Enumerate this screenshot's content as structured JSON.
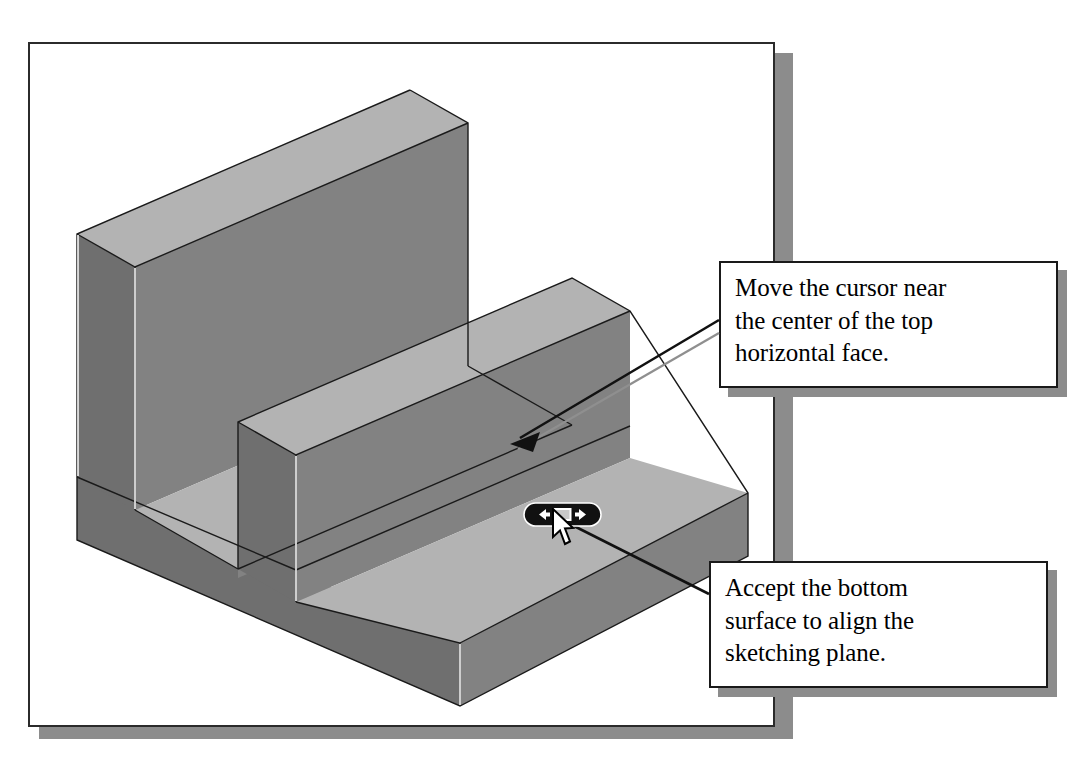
{
  "figure": {
    "frame": {
      "border_color": "#2b2b2b",
      "shadow_color": "#8c8c8c",
      "background": "#ffffff"
    }
  },
  "model": {
    "description": "isometric U-channel solid",
    "top_face_color": "#b3b3b3",
    "front_face_color": "#828282",
    "side_face_color": "#6f6f6f",
    "edge_color": "#1a1a1a",
    "highlight_edge_color": "#f2f2f2"
  },
  "callouts": [
    {
      "id": "callout-move-cursor",
      "text": "Move the cursor near the center of the top horizontal face.",
      "lines": [
        "Move the cursor near",
        "the center of the top",
        "horizontal face."
      ]
    },
    {
      "id": "callout-accept-surface",
      "text": "Accept the bottom surface to align the sketching plane.",
      "lines": [
        "Accept the bottom",
        "surface to align the",
        "sketching plane."
      ]
    }
  ],
  "widget": {
    "name": "face-cycle-widget",
    "left_arrow": "left-arrow-icon",
    "right_arrow": "right-arrow-icon",
    "center_button": "accept-face-button",
    "body_color": "#111111",
    "arrow_color": "#ffffff",
    "center_color": "#c9c9c9"
  },
  "cursor": {
    "name": "mouse-pointer",
    "fill": "#ffffff",
    "outline": "#000000"
  }
}
